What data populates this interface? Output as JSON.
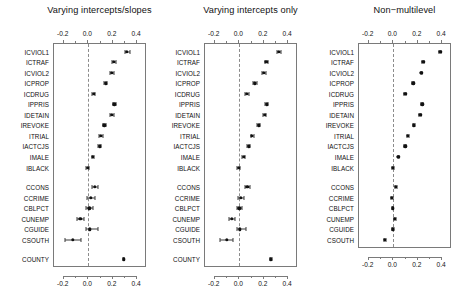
{
  "figure": {
    "width": 459,
    "height": 284,
    "background": "#ffffff",
    "point_color": "#111111",
    "line_color": "#3a3a3a",
    "box_color": "#7a7a7a",
    "zero_line_color": "#8c8c8c"
  },
  "chart_data": {
    "type": "scatter",
    "title": "",
    "xlabel": "",
    "ylabel": "",
    "xlim": [
      -0.28,
      0.48
    ],
    "xticks": [
      -0.2,
      0.0,
      0.2,
      0.4
    ],
    "xticklabels": [
      "-0.2",
      "0.0",
      "0.2",
      "0.4"
    ],
    "grid": false,
    "legend": "none",
    "zero_reference_line": 0.0,
    "annotations": "Dashed vertical reference line at x = 0 in each panel; horizontal segments are confidence intervals with end caps.",
    "categories": [
      "ICVIOL1",
      "ICTRAF",
      "ICVIOL2",
      "ICPROP",
      "ICDRUG",
      "IPPRIS",
      "IDETAIN",
      "IREVOKE",
      "ITRIAL",
      "IACTCJS",
      "IMALE",
      "IBLACK",
      "CCONS",
      "CCRIME",
      "CBLPCT",
      "CUNEMP",
      "CGUIDE",
      "CSOUTH",
      "COUNTY"
    ],
    "category_groups": [
      {
        "name": "individual-level",
        "labels": [
          "ICVIOL1",
          "ICTRAF",
          "ICVIOL2",
          "ICPROP",
          "ICDRUG",
          "IPPRIS",
          "IDETAIN",
          "IREVOKE",
          "ITRIAL",
          "IACTCJS",
          "IMALE",
          "IBLACK"
        ]
      },
      {
        "name": "county-level",
        "labels": [
          "CCONS",
          "CCRIME",
          "CBLPCT",
          "CUNEMP",
          "CGUIDE",
          "CSOUTH"
        ]
      },
      {
        "name": "variance-component",
        "labels": [
          "COUNTY"
        ]
      }
    ],
    "panels": [
      {
        "id": "panel-varying-intercepts-slopes",
        "title": "Varying intercepts/slopes",
        "points": [
          {
            "label": "ICVIOL1",
            "estimate": 0.325,
            "lower": 0.305,
            "upper": 0.35
          },
          {
            "label": "ICTRAF",
            "estimate": 0.215,
            "lower": 0.2,
            "upper": 0.232
          },
          {
            "label": "ICVIOL2",
            "estimate": 0.203,
            "lower": 0.186,
            "upper": 0.22
          },
          {
            "label": "ICPROP",
            "estimate": 0.15,
            "lower": 0.136,
            "upper": 0.164
          },
          {
            "label": "ICDRUG",
            "estimate": 0.053,
            "lower": 0.04,
            "upper": 0.067
          },
          {
            "label": "IPPRIS",
            "estimate": 0.222,
            "lower": 0.208,
            "upper": 0.236
          },
          {
            "label": "IDETAIN",
            "estimate": 0.202,
            "lower": 0.188,
            "upper": 0.216
          },
          {
            "label": "IREVOKE",
            "estimate": 0.14,
            "lower": 0.126,
            "upper": 0.154
          },
          {
            "label": "ITRIAL",
            "estimate": 0.112,
            "lower": 0.096,
            "upper": 0.128
          },
          {
            "label": "IACTCJS",
            "estimate": 0.1,
            "lower": 0.088,
            "upper": 0.113
          },
          {
            "label": "IMALE",
            "estimate": 0.047,
            "lower": 0.036,
            "upper": 0.058
          },
          {
            "label": "IBLACK",
            "estimate": 0.003,
            "lower": -0.008,
            "upper": 0.014
          },
          {
            "label": "CCONS",
            "estimate": 0.064,
            "lower": 0.04,
            "upper": 0.09
          },
          {
            "label": "CCRIME",
            "estimate": 0.03,
            "lower": 0.0,
            "upper": 0.062
          },
          {
            "label": "CBLPCT",
            "estimate": 0.018,
            "lower": -0.012,
            "upper": 0.05
          },
          {
            "label": "CUNEMP",
            "estimate": -0.057,
            "lower": -0.086,
            "upper": -0.028
          },
          {
            "label": "CGUIDE",
            "estimate": 0.021,
            "lower": -0.013,
            "upper": 0.09
          },
          {
            "label": "CSOUTH",
            "estimate": -0.117,
            "lower": -0.185,
            "upper": -0.048
          },
          {
            "label": "COUNTY",
            "estimate": 0.298,
            "lower": 0.292,
            "upper": 0.304
          }
        ]
      },
      {
        "id": "panel-varying-intercepts-only",
        "title": "Varying intercepts only",
        "points": [
          {
            "label": "ICVIOL1",
            "estimate": 0.33,
            "lower": 0.313,
            "upper": 0.348
          },
          {
            "label": "ICTRAF",
            "estimate": 0.229,
            "lower": 0.215,
            "upper": 0.243
          },
          {
            "label": "ICVIOL2",
            "estimate": 0.209,
            "lower": 0.195,
            "upper": 0.223
          },
          {
            "label": "ICPROP",
            "estimate": 0.137,
            "lower": 0.124,
            "upper": 0.15
          },
          {
            "label": "ICDRUG",
            "estimate": 0.071,
            "lower": 0.058,
            "upper": 0.085
          },
          {
            "label": "IPPRIS",
            "estimate": 0.232,
            "lower": 0.22,
            "upper": 0.245
          },
          {
            "label": "IDETAIN",
            "estimate": 0.216,
            "lower": 0.203,
            "upper": 0.229
          },
          {
            "label": "IREVOKE",
            "estimate": 0.166,
            "lower": 0.153,
            "upper": 0.179
          },
          {
            "label": "ITRIAL",
            "estimate": 0.113,
            "lower": 0.1,
            "upper": 0.126
          },
          {
            "label": "IACTCJS",
            "estimate": 0.086,
            "lower": 0.074,
            "upper": 0.098
          },
          {
            "label": "IMALE",
            "estimate": 0.044,
            "lower": 0.033,
            "upper": 0.055
          },
          {
            "label": "IBLACK",
            "estimate": 0.002,
            "lower": -0.008,
            "upper": 0.013
          },
          {
            "label": "CCONS",
            "estimate": 0.074,
            "lower": 0.055,
            "upper": 0.094
          },
          {
            "label": "CCRIME",
            "estimate": 0.022,
            "lower": 0.0,
            "upper": 0.048
          },
          {
            "label": "CBLPCT",
            "estimate": 0.01,
            "lower": -0.013,
            "upper": 0.034
          },
          {
            "label": "CUNEMP",
            "estimate": -0.054,
            "lower": -0.078,
            "upper": -0.03
          },
          {
            "label": "CGUIDE",
            "estimate": 0.012,
            "lower": -0.014,
            "upper": 0.06
          },
          {
            "label": "CSOUTH",
            "estimate": -0.096,
            "lower": -0.152,
            "upper": -0.04
          },
          {
            "label": "COUNTY",
            "estimate": 0.268,
            "lower": 0.262,
            "upper": 0.274
          }
        ]
      },
      {
        "id": "panel-non-multilevel",
        "title": "Non−multilevel",
        "points": [
          {
            "label": "ICVIOL1",
            "estimate": 0.394,
            "lower": 0.386,
            "upper": 0.402
          },
          {
            "label": "ICTRAF",
            "estimate": 0.253,
            "lower": 0.246,
            "upper": 0.26
          },
          {
            "label": "ICVIOL2",
            "estimate": 0.238,
            "lower": 0.231,
            "upper": 0.246
          },
          {
            "label": "ICPROP",
            "estimate": 0.172,
            "lower": 0.165,
            "upper": 0.18
          },
          {
            "label": "ICDRUG",
            "estimate": 0.105,
            "lower": 0.097,
            "upper": 0.113
          },
          {
            "label": "IPPRIS",
            "estimate": 0.244,
            "lower": 0.237,
            "upper": 0.251
          },
          {
            "label": "IDETAIN",
            "estimate": 0.228,
            "lower": 0.221,
            "upper": 0.235
          },
          {
            "label": "IREVOKE",
            "estimate": 0.178,
            "lower": 0.171,
            "upper": 0.185
          },
          {
            "label": "ITRIAL",
            "estimate": 0.126,
            "lower": 0.119,
            "upper": 0.133
          },
          {
            "label": "IACTCJS",
            "estimate": 0.105,
            "lower": 0.098,
            "upper": 0.112
          },
          {
            "label": "IMALE",
            "estimate": 0.05,
            "lower": 0.043,
            "upper": 0.057
          },
          {
            "label": "IBLACK",
            "estimate": 0.006,
            "lower": -0.002,
            "upper": 0.013
          },
          {
            "label": "CCONS",
            "estimate": 0.031,
            "lower": 0.025,
            "upper": 0.037
          },
          {
            "label": "CCRIME",
            "estimate": -0.003,
            "lower": -0.01,
            "upper": 0.004
          },
          {
            "label": "CBLPCT",
            "estimate": 0.002,
            "lower": -0.005,
            "upper": 0.009
          },
          {
            "label": "CUNEMP",
            "estimate": 0.022,
            "lower": 0.015,
            "upper": 0.029
          },
          {
            "label": "CGUIDE",
            "estimate": 0.005,
            "lower": -0.004,
            "upper": 0.014
          },
          {
            "label": "CSOUTH",
            "estimate": -0.062,
            "lower": -0.07,
            "upper": -0.054
          }
        ]
      }
    ]
  }
}
